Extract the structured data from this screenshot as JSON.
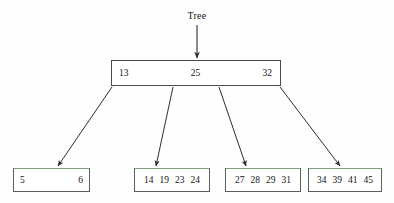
{
  "diagram": {
    "title": "Tree",
    "type": "b-plus-tree",
    "colors": {
      "background": "#fefefe",
      "box_border": "#4a4a4a",
      "leaf_border": "#5c5c5c",
      "leaf_top_accent": "#7f9d7f",
      "edge": "#2e2e2e",
      "text": "#141414"
    },
    "root_pointer_label": "Tree",
    "root_node": {
      "name": "root-node",
      "keys": [
        "13",
        "25",
        "32"
      ]
    },
    "leaf_nodes": [
      {
        "name": "leaf-node-1",
        "keys": [
          "5",
          "6"
        ]
      },
      {
        "name": "leaf-node-2",
        "keys": [
          "14",
          "19",
          "23",
          "24"
        ]
      },
      {
        "name": "leaf-node-3",
        "keys": [
          "27",
          "28",
          "29",
          "31"
        ]
      },
      {
        "name": "leaf-node-4",
        "keys": [
          "34",
          "39",
          "41",
          "45"
        ]
      }
    ],
    "edges": [
      {
        "name": "edge-root-to-leaf-1",
        "from": "root-node",
        "to": "leaf-node-1"
      },
      {
        "name": "edge-root-to-leaf-2",
        "from": "root-node",
        "to": "leaf-node-2"
      },
      {
        "name": "edge-root-to-leaf-3",
        "from": "root-node",
        "to": "leaf-node-3"
      },
      {
        "name": "edge-root-to-leaf-4",
        "from": "root-node",
        "to": "leaf-node-4"
      },
      {
        "name": "edge-tree-pointer",
        "from": "Tree",
        "to": "root-node"
      }
    ]
  }
}
